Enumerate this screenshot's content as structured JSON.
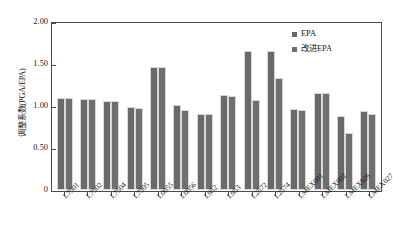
{
  "chart_data": {
    "type": "bar",
    "title": "",
    "xlabel": "",
    "ylabel": "调整系数(PGA/EPA)",
    "ylim": [
      0,
      2.0
    ],
    "yticks": [
      "0",
      "0.50",
      "1.00",
      "1.50",
      "2.00"
    ],
    "ytick_values": [
      0,
      0.5,
      1.0,
      1.5,
      2.0
    ],
    "grid": false,
    "legend_position": "top-right",
    "categories": [
      "L7501",
      "L7502",
      "L7504",
      "L7505",
      "L0055",
      "L0056",
      "L952",
      "L953",
      "L2572",
      "L2574",
      "LMEX001",
      "LMEX002",
      "LMEX026",
      "LMEX027"
    ],
    "series": [
      {
        "name": "EPA",
        "color": "#696969",
        "values": [
          1.09,
          1.08,
          1.06,
          0.99,
          1.47,
          1.01,
          0.9,
          1.13,
          1.66,
          1.66,
          0.96,
          1.16,
          0.88,
          0.94
        ]
      },
      {
        "name": "改进EPA",
        "color": "#6f6f6f",
        "values": [
          1.09,
          1.08,
          1.06,
          0.98,
          1.46,
          0.95,
          0.9,
          1.12,
          1.07,
          1.33,
          0.95,
          1.15,
          0.68,
          0.9
        ]
      }
    ]
  },
  "legend": {
    "items": [
      {
        "label": "EPA"
      },
      {
        "label": "改进EPA"
      }
    ]
  }
}
